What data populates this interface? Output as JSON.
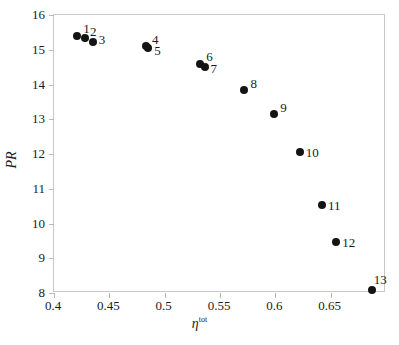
{
  "figure": {
    "background": "#ffffff",
    "point_color": "#141414",
    "frame_color": "#c9c9c9"
  },
  "chart_data": {
    "type": "scatter",
    "title": "",
    "xlabel": "η",
    "xlabel_sup": "tot",
    "ylabel": "PR",
    "xlim": [
      0.4,
      0.7
    ],
    "ylim": [
      8,
      16
    ],
    "grid": false,
    "legend": "none",
    "xticks": [
      0.4,
      0.45,
      0.5,
      0.55,
      0.6,
      0.65
    ],
    "xtick_labels": [
      "0.4",
      "0.45",
      "0.5",
      "0.55",
      "0.6",
      "0.65"
    ],
    "yticks": [
      8,
      9,
      10,
      11,
      12,
      13,
      14,
      15,
      16
    ],
    "ytick_labels": [
      "8",
      "9",
      "10",
      "11",
      "12",
      "13",
      "14",
      "15",
      "16"
    ],
    "points": [
      {
        "label": "1",
        "x": 0.422,
        "y": 15.37,
        "label_dx": 6,
        "label_dy": -14
      },
      {
        "label": "2",
        "x": 0.429,
        "y": 15.31,
        "label_dx": 5,
        "label_dy": -13
      },
      {
        "label": "3",
        "x": 0.436,
        "y": 15.2,
        "label_dx": 6,
        "label_dy": -9
      },
      {
        "label": "4",
        "x": 0.484,
        "y": 15.08,
        "label_dx": 6,
        "label_dy": -13
      },
      {
        "label": "5",
        "x": 0.486,
        "y": 15.02,
        "label_dx": 6,
        "label_dy": -4
      },
      {
        "label": "6",
        "x": 0.533,
        "y": 14.55,
        "label_dx": 6,
        "label_dy": -14
      },
      {
        "label": "7",
        "x": 0.537,
        "y": 14.48,
        "label_dx": 6,
        "label_dy": -5
      },
      {
        "label": "8",
        "x": 0.573,
        "y": 13.82,
        "label_dx": 6,
        "label_dy": -13
      },
      {
        "label": "9",
        "x": 0.6,
        "y": 13.12,
        "label_dx": 6,
        "label_dy": -13
      },
      {
        "label": "10",
        "x": 0.623,
        "y": 12.03,
        "label_dx": 6,
        "label_dy": -6
      },
      {
        "label": "11",
        "x": 0.643,
        "y": 10.5,
        "label_dx": 6,
        "label_dy": -6
      },
      {
        "label": "12",
        "x": 0.656,
        "y": 9.43,
        "label_dx": 6,
        "label_dy": -6
      },
      {
        "label": "13",
        "x": 0.688,
        "y": 8.05,
        "label_dx": 2,
        "label_dy": -17
      }
    ]
  }
}
